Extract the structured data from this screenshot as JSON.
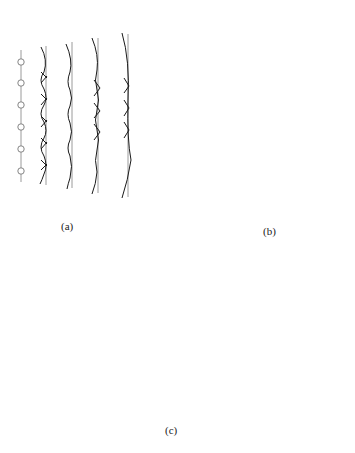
{
  "figure": {
    "panels": [
      {
        "id": "a",
        "label": "(a)",
        "description": "Plane wavefronts built from a straight row of point sources (Huygens wavelets)",
        "source_count": 6,
        "wavefront_count": 4
      },
      {
        "id": "b",
        "label": "(b)",
        "description": "Circular wavefronts built from a curved arc of point sources",
        "source_count": 8,
        "wavefront_count": 3
      },
      {
        "id": "c",
        "label": "(c)",
        "description": "Plane waves diffracting through a slit in a barrier",
        "incident_wave_count": 5,
        "source_count": 4,
        "diffracted_wave_count": 7
      }
    ],
    "colors": {
      "wave_black": "#1a1a1a",
      "wave_gray": "#9a9a9a",
      "source_stroke": "#777777",
      "barrier": "#000000"
    }
  }
}
